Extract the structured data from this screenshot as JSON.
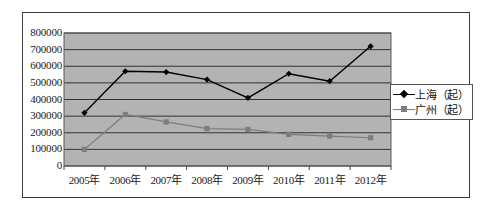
{
  "chart_data": {
    "type": "line",
    "title": "",
    "subtitle": "",
    "xlabel": "",
    "ylabel": "",
    "categories": [
      "2005年",
      "2006年",
      "2007年",
      "2008年",
      "2009年",
      "2010年",
      "2011年",
      "2012年"
    ],
    "series": [
      {
        "name": "上海（起）",
        "marker": "diamond",
        "color": "#000000",
        "values": [
          320000,
          570000,
          565000,
          520000,
          410000,
          555000,
          510000,
          720000
        ]
      },
      {
        "name": "广州（起）",
        "marker": "square",
        "color": "#7d7d7d",
        "values": [
          100000,
          310000,
          265000,
          225000,
          220000,
          190000,
          180000,
          170000
        ]
      }
    ],
    "ylim": [
      0,
      800000
    ],
    "ytick_labels": [
      "800000",
      "700000",
      "600000",
      "500000",
      "400000",
      "300000",
      "200000",
      "100000",
      "0"
    ],
    "ytick_values": [
      800000,
      700000,
      600000,
      500000,
      400000,
      300000,
      200000,
      100000,
      0
    ],
    "grid": true,
    "grid_axis": "y",
    "legend_position": "right",
    "plot_background": "#b3b3b3",
    "grid_color": "#333333",
    "plot_border_color": "#555555"
  },
  "legend": {
    "entries": [
      {
        "label": "上海（起）",
        "marker": "diamond-marker-icon"
      },
      {
        "label": "广州（起）",
        "marker": "square-marker-icon"
      }
    ]
  }
}
